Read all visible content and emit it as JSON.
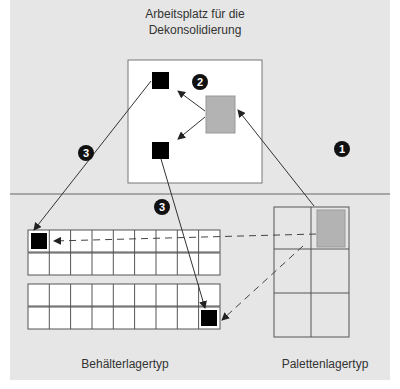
{
  "diagram": {
    "title_line1": "Arbeitsplatz für die",
    "title_line2": "Dekonsolidierung",
    "bin_storage_label": "Behälterlagertyp",
    "pallet_storage_label": "Palettenlagertyp",
    "steps": [
      {
        "number": "1",
        "meaning": "pallet from pallet storage to workstation"
      },
      {
        "number": "2",
        "meaning": "deconsolidation into bins"
      },
      {
        "number": "3",
        "meaning": "bins to bin storage"
      }
    ],
    "bin_storage": {
      "columns": 9,
      "blocks": 2,
      "rows_per_block": 2
    },
    "pallet_storage": {
      "columns": 2,
      "rows": 3
    },
    "colors": {
      "background": "#e6e6e6",
      "pallet": "#b3b3b3",
      "bin": "#000000",
      "line": "#333333"
    }
  }
}
